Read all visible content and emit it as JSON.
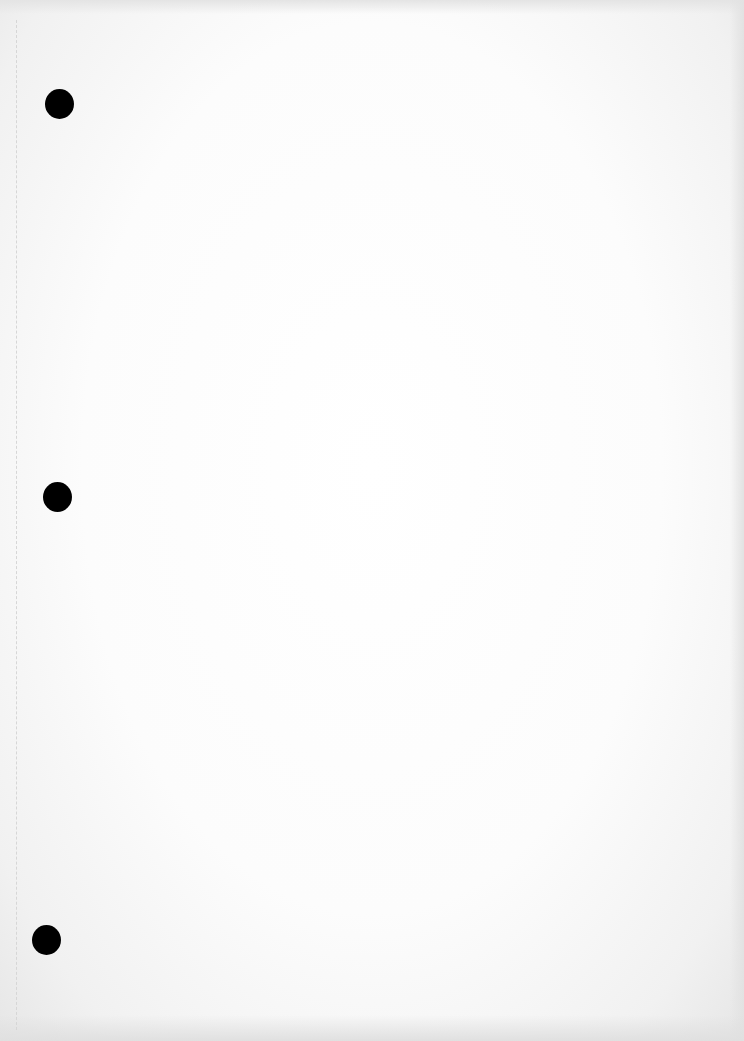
{
  "document": {
    "type": "blank scanned page",
    "text": "",
    "punch_holes": [
      {
        "id": "top",
        "x": 45,
        "y": 89
      },
      {
        "id": "middle",
        "x": 43,
        "y": 482
      },
      {
        "id": "bottom",
        "x": 32,
        "y": 925
      }
    ],
    "colors": {
      "paper": "#ffffff",
      "hole": "#000000",
      "scan_edge": "#e4e4e4"
    }
  }
}
